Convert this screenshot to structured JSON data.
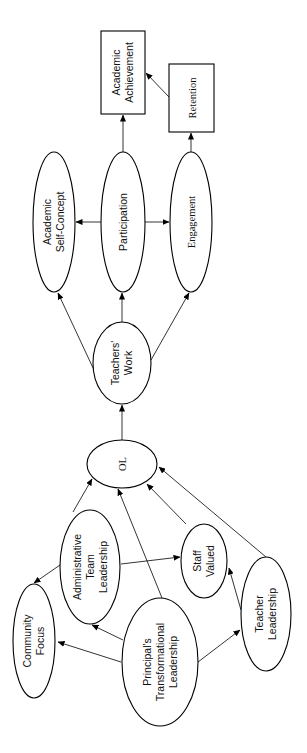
{
  "diagram": {
    "nodes": {
      "academic_achievement": {
        "line1": "Academic",
        "line2": "Achievement"
      },
      "retention": {
        "label": "Retention"
      },
      "academic_self_concept": {
        "line1": "Academic",
        "line2": "Self-Concept"
      },
      "participation": {
        "label": "Participation"
      },
      "engagement": {
        "label": "Engagement"
      },
      "teachers_work": {
        "line1": "Teachers'",
        "line2": "Work"
      },
      "ol": {
        "label": "OL"
      },
      "administrative_team_leadership": {
        "line1": "Administrative",
        "line2": "Team",
        "line3": "Leadership"
      },
      "community_focus": {
        "line1": "Community",
        "line2": "Focus"
      },
      "staff_valued": {
        "line1": "Staff",
        "line2": "Valued"
      },
      "principals_transformational_leadership": {
        "line1": "Principal's",
        "line2": "Transformational",
        "line3": "Leadership"
      },
      "teacher_leadership": {
        "line1": "Teacher",
        "line2": "Leadership"
      }
    },
    "edges": [
      {
        "from": "Principal's Transformational Leadership",
        "to": "Community Focus"
      },
      {
        "from": "Principal's Transformational Leadership",
        "to": "Administrative Team Leadership"
      },
      {
        "from": "Principal's Transformational Leadership",
        "to": "Teacher Leadership"
      },
      {
        "from": "Principal's Transformational Leadership",
        "to": "OL"
      },
      {
        "from": "Administrative Team Leadership",
        "to": "Community Focus"
      },
      {
        "from": "Administrative Team Leadership",
        "to": "Staff Valued"
      },
      {
        "from": "Administrative Team Leadership",
        "to": "OL"
      },
      {
        "from": "Teacher Leadership",
        "to": "Staff Valued"
      },
      {
        "from": "Teacher Leadership",
        "to": "OL"
      },
      {
        "from": "Staff Valued",
        "to": "OL"
      },
      {
        "from": "OL",
        "to": "Teachers' Work"
      },
      {
        "from": "Teachers' Work",
        "to": "Academic Self-Concept"
      },
      {
        "from": "Teachers' Work",
        "to": "Participation"
      },
      {
        "from": "Teachers' Work",
        "to": "Engagement"
      },
      {
        "from": "Participation",
        "to": "Academic Self-Concept"
      },
      {
        "from": "Participation",
        "to": "Engagement"
      },
      {
        "from": "Participation",
        "to": "Academic Achievement"
      },
      {
        "from": "Engagement",
        "to": "Retention"
      },
      {
        "from": "Retention",
        "to": "Academic Achievement"
      }
    ],
    "orientation": "rotated 90 degrees counter-clockwise"
  }
}
